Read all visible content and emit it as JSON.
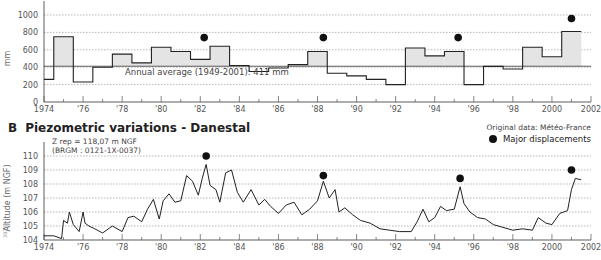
{
  "panel_b": {
    "letter": "B",
    "title": "Piezometric variations - Danestal",
    "zrep_line1": "Z rep  =  118,07 m NGF",
    "zrep_line2": "(BRGM : 0121-1X-0037)"
  },
  "source_note": "Original data: Météo-France",
  "legend": {
    "dot_label": "Major displacements"
  },
  "side_code": "3936",
  "colors": {
    "fill": "#e4e4e4",
    "line": "#222222",
    "grid": "#888888",
    "dot": "#111111"
  },
  "chart_data": [
    {
      "id": "A",
      "type": "bar",
      "title": "Annual rainfall (step histogram)",
      "ylabel": "mm",
      "xlabel": "",
      "ylim": [
        0,
        1000
      ],
      "yticks": [
        0,
        200,
        400,
        600,
        800,
        1000
      ],
      "grid": true,
      "xticks": [
        "1974",
        "'76",
        "'78",
        "'80",
        "'82",
        "'84",
        "'86",
        "'88",
        "'90",
        "'92",
        "'94",
        "'96",
        "'98",
        "2000",
        "2002"
      ],
      "categories": [
        1974,
        1975,
        1976,
        1977,
        1978,
        1979,
        1980,
        1981,
        1982,
        1983,
        1984,
        1985,
        1986,
        1987,
        1988,
        1989,
        1990,
        1991,
        1992,
        1993,
        1994,
        1995,
        1996,
        1997,
        1998,
        1999,
        2000,
        2001
      ],
      "values": [
        260,
        750,
        230,
        400,
        550,
        450,
        630,
        580,
        490,
        640,
        420,
        350,
        390,
        430,
        580,
        330,
        300,
        260,
        200,
        620,
        530,
        580,
        200,
        410,
        380,
        630,
        520,
        810
      ],
      "reference_line": {
        "value": 411,
        "label": "Annual average (1949-2001): 411 mm"
      },
      "markers": [
        {
          "x": 1982.2,
          "y": 740
        },
        {
          "x": 1988.3,
          "y": 740
        },
        {
          "x": 1995.2,
          "y": 740
        },
        {
          "x": 2001.0,
          "y": 960
        }
      ]
    },
    {
      "id": "B",
      "type": "line",
      "title": "Piezometric variations - Danestal",
      "ylabel": "Altitude (m NGF)",
      "xlabel": "",
      "ylim": [
        104,
        110
      ],
      "yticks": [
        104,
        105,
        106,
        107,
        108,
        109,
        110
      ],
      "grid": true,
      "xticks": [
        "1974",
        "'76",
        "'78",
        "'80",
        "'82",
        "'84",
        "'86",
        "'88",
        "'90",
        "'92",
        "'94",
        "'96",
        "'98",
        "2000",
        "2002"
      ],
      "x": [
        1974.0,
        1974.5,
        1974.9,
        1975.0,
        1975.2,
        1975.3,
        1975.5,
        1975.8,
        1976.0,
        1976.1,
        1976.3,
        1976.6,
        1977.0,
        1977.5,
        1978.0,
        1978.3,
        1978.6,
        1979.0,
        1979.3,
        1979.6,
        1979.9,
        1980.1,
        1980.4,
        1980.7,
        1981.0,
        1981.3,
        1981.6,
        1981.9,
        1982.1,
        1982.3,
        1982.5,
        1982.8,
        1983.0,
        1983.3,
        1983.6,
        1983.9,
        1984.2,
        1984.6,
        1985.0,
        1985.3,
        1985.6,
        1986.0,
        1986.4,
        1986.8,
        1987.2,
        1987.6,
        1988.0,
        1988.3,
        1988.6,
        1988.9,
        1989.1,
        1989.4,
        1989.8,
        1990.2,
        1990.7,
        1991.2,
        1991.7,
        1992.2,
        1992.8,
        1993.1,
        1993.4,
        1993.7,
        1994.0,
        1994.3,
        1994.6,
        1995.0,
        1995.3,
        1995.5,
        1995.8,
        1996.2,
        1996.6,
        1997.0,
        1997.5,
        1998.0,
        1998.5,
        1999.0,
        1999.3,
        1999.7,
        2000.0,
        2000.4,
        2000.8,
        2001.0,
        2001.2,
        2001.5
      ],
      "values": [
        104.3,
        104.3,
        104.1,
        105.4,
        105.2,
        106.0,
        105.1,
        104.6,
        106.0,
        105.2,
        105.0,
        104.8,
        104.5,
        105.0,
        104.6,
        105.6,
        105.7,
        105.3,
        106.2,
        106.9,
        105.5,
        106.8,
        107.3,
        106.7,
        106.8,
        108.6,
        108.2,
        107.2,
        108.4,
        109.4,
        107.9,
        107.6,
        106.7,
        108.8,
        109.0,
        107.4,
        106.7,
        107.6,
        106.5,
        106.9,
        106.4,
        105.9,
        106.5,
        106.7,
        105.8,
        106.2,
        106.8,
        108.2,
        107.0,
        107.6,
        106.0,
        106.3,
        105.8,
        105.4,
        105.2,
        104.8,
        104.7,
        104.6,
        104.6,
        105.3,
        106.2,
        105.3,
        105.6,
        106.4,
        106.1,
        106.2,
        107.8,
        106.6,
        106.0,
        105.6,
        105.5,
        105.1,
        104.9,
        104.7,
        104.8,
        104.7,
        105.6,
        105.2,
        105.1,
        105.9,
        106.1,
        107.6,
        108.4,
        108.3
      ],
      "markers": [
        {
          "x": 1982.3,
          "y": 110.0
        },
        {
          "x": 1988.3,
          "y": 108.6
        },
        {
          "x": 1995.3,
          "y": 108.4
        },
        {
          "x": 2001.0,
          "y": 109.0
        }
      ]
    }
  ]
}
